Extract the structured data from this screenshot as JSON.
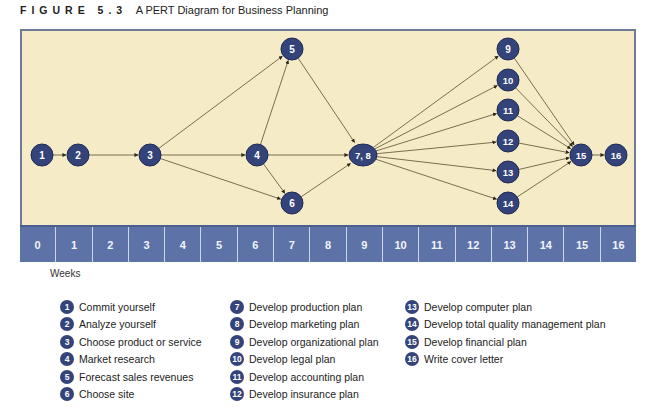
{
  "figure": {
    "label": "FIGURE 5.3",
    "title": "A PERT Diagram for Business Planning"
  },
  "colors": {
    "background": "#f5ecc7",
    "node_fill": "#34437a",
    "node_stroke": "#1f2a55",
    "edge": "#5a4e2e",
    "timeline": "#5d73a8",
    "frame": "#6e7a96"
  },
  "timeline": {
    "weeks": [
      "0",
      "1",
      "2",
      "3",
      "4",
      "5",
      "6",
      "7",
      "8",
      "9",
      "10",
      "11",
      "12",
      "13",
      "14",
      "15",
      "16"
    ],
    "axis_label": "Weeks"
  },
  "nodes": [
    {
      "id": "1",
      "label": "1",
      "x": 42,
      "y": 155
    },
    {
      "id": "2",
      "label": "2",
      "x": 78,
      "y": 155
    },
    {
      "id": "3",
      "label": "3",
      "x": 150,
      "y": 155
    },
    {
      "id": "4",
      "label": "4",
      "x": 257,
      "y": 155
    },
    {
      "id": "5",
      "label": "5",
      "x": 292,
      "y": 49
    },
    {
      "id": "6",
      "label": "6",
      "x": 292,
      "y": 203
    },
    {
      "id": "78",
      "label": "7, 8",
      "x": 363,
      "y": 155
    },
    {
      "id": "9",
      "label": "9",
      "x": 508,
      "y": 49
    },
    {
      "id": "10",
      "label": "10",
      "x": 508,
      "y": 80
    },
    {
      "id": "11",
      "label": "11",
      "x": 508,
      "y": 110
    },
    {
      "id": "12",
      "label": "12",
      "x": 508,
      "y": 141
    },
    {
      "id": "13",
      "label": "13",
      "x": 508,
      "y": 172
    },
    {
      "id": "14",
      "label": "14",
      "x": 508,
      "y": 203
    },
    {
      "id": "15",
      "label": "15",
      "x": 581,
      "y": 155
    },
    {
      "id": "16",
      "label": "16",
      "x": 616,
      "y": 155
    }
  ],
  "edges": [
    [
      "1",
      "2"
    ],
    [
      "2",
      "3"
    ],
    [
      "3",
      "5"
    ],
    [
      "3",
      "4"
    ],
    [
      "3",
      "6"
    ],
    [
      "4",
      "5"
    ],
    [
      "4",
      "78"
    ],
    [
      "4",
      "6"
    ],
    [
      "5",
      "78"
    ],
    [
      "6",
      "78"
    ],
    [
      "78",
      "9"
    ],
    [
      "78",
      "10"
    ],
    [
      "78",
      "11"
    ],
    [
      "78",
      "12"
    ],
    [
      "78",
      "13"
    ],
    [
      "78",
      "14"
    ],
    [
      "9",
      "15"
    ],
    [
      "10",
      "15"
    ],
    [
      "11",
      "15"
    ],
    [
      "12",
      "15"
    ],
    [
      "13",
      "15"
    ],
    [
      "14",
      "15"
    ],
    [
      "15",
      "16"
    ]
  ],
  "legend": {
    "columns": [
      [
        {
          "num": "1",
          "text": "Commit yourself"
        },
        {
          "num": "2",
          "text": "Analyze yourself"
        },
        {
          "num": "3",
          "text": "Choose product or service"
        },
        {
          "num": "4",
          "text": "Market research"
        },
        {
          "num": "5",
          "text": "Forecast sales revenues"
        },
        {
          "num": "6",
          "text": "Choose site"
        }
      ],
      [
        {
          "num": "7",
          "text": "Develop production plan"
        },
        {
          "num": "8",
          "text": "Develop marketing plan"
        },
        {
          "num": "9",
          "text": "Develop organizational plan"
        },
        {
          "num": "10",
          "text": "Develop legal plan"
        },
        {
          "num": "11",
          "text": "Develop accounting plan"
        },
        {
          "num": "12",
          "text": "Develop insurance plan"
        }
      ],
      [
        {
          "num": "13",
          "text": "Develop computer plan"
        },
        {
          "num": "14",
          "text": "Develop total quality management plan"
        },
        {
          "num": "15",
          "text": "Develop financial plan"
        },
        {
          "num": "16",
          "text": "Write cover letter"
        }
      ]
    ]
  }
}
